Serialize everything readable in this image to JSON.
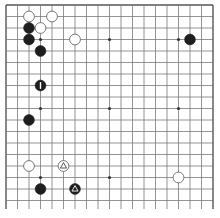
{
  "board": {
    "size": 19,
    "origin_x": 6,
    "origin_y": 5,
    "spacing": 11.5,
    "line_color": "#7a7a7a",
    "border_color": "#555555",
    "background": "#ffffff",
    "star_points": [
      [
        3,
        3
      ],
      [
        9,
        3
      ],
      [
        15,
        3
      ],
      [
        3,
        9
      ],
      [
        9,
        9
      ],
      [
        15,
        9
      ],
      [
        3,
        15
      ],
      [
        9,
        15
      ],
      [
        15,
        15
      ]
    ],
    "stones": [
      {
        "color": "white",
        "col": 2,
        "row": 1
      },
      {
        "color": "white",
        "col": 4,
        "row": 1
      },
      {
        "color": "black",
        "col": 2,
        "row": 2
      },
      {
        "color": "white",
        "col": 3,
        "row": 2
      },
      {
        "color": "black",
        "col": 2,
        "row": 3
      },
      {
        "color": "black",
        "col": 3,
        "row": 4
      },
      {
        "color": "white",
        "col": 6,
        "row": 3
      },
      {
        "color": "black",
        "col": 16,
        "row": 3
      },
      {
        "color": "black",
        "col": 3,
        "row": 7,
        "mark": "1"
      },
      {
        "color": "black",
        "col": 2,
        "row": 10
      },
      {
        "color": "white",
        "col": 2,
        "row": 14
      },
      {
        "color": "white",
        "col": 5,
        "row": 14,
        "mark": "triangle"
      },
      {
        "color": "black",
        "col": 3,
        "row": 16
      },
      {
        "color": "black",
        "col": 6,
        "row": 16,
        "mark": "triangle"
      },
      {
        "color": "white",
        "col": 15,
        "row": 15
      }
    ]
  }
}
